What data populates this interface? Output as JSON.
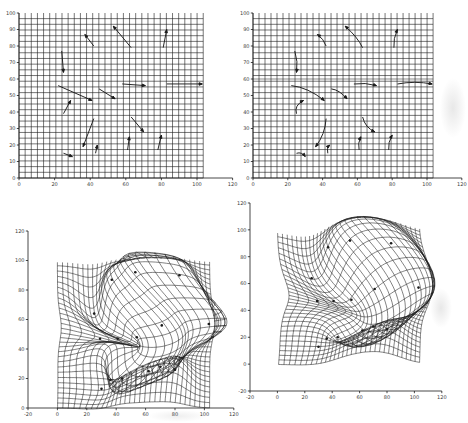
{
  "figure": {
    "background": "#ffffff",
    "ink": "#1b1b1b",
    "label_color": "#3a3a3a"
  },
  "landmarks": {
    "source": [
      [
        24,
        77
      ],
      [
        42,
        80
      ],
      [
        63,
        79
      ],
      [
        81,
        79
      ],
      [
        22,
        56
      ],
      [
        45,
        54
      ],
      [
        58,
        57
      ],
      [
        83,
        57
      ],
      [
        25,
        39
      ],
      [
        42,
        36
      ],
      [
        63,
        37
      ],
      [
        25,
        15
      ],
      [
        43,
        15
      ],
      [
        61,
        17
      ],
      [
        78,
        17
      ]
    ],
    "target": [
      [
        25,
        64
      ],
      [
        37,
        87
      ],
      [
        53,
        92
      ],
      [
        83,
        90
      ],
      [
        41,
        47
      ],
      [
        54,
        48
      ],
      [
        71,
        56
      ],
      [
        103,
        57
      ],
      [
        29,
        47
      ],
      [
        36,
        19
      ],
      [
        70,
        28
      ],
      [
        30,
        13
      ],
      [
        44,
        20
      ],
      [
        62,
        25
      ],
      [
        80,
        26
      ]
    ],
    "curve_ctrl_offsets": [
      [
        1.5,
        0
      ],
      [
        1,
        1
      ],
      [
        2,
        0
      ],
      [
        -1.5,
        0
      ],
      [
        0,
        3.5
      ],
      [
        0,
        2.5
      ],
      [
        0,
        1.5
      ],
      [
        0,
        2
      ],
      [
        -3.5,
        1
      ],
      [
        2.5,
        -1
      ],
      [
        -2,
        -2
      ],
      [
        0.5,
        2
      ],
      [
        -1.5,
        0.5
      ],
      [
        -1.5,
        0
      ],
      [
        -1.5,
        0
      ]
    ]
  },
  "chart_data": [
    {
      "id": "top-left",
      "type": "scatter",
      "subtype": "vector-field-on-regular-grid",
      "title": "",
      "xlabel": "",
      "ylabel": "",
      "x_range": [
        0,
        120
      ],
      "y_range": [
        0,
        100
      ],
      "x_ticks": [
        0,
        20,
        40,
        60,
        80,
        100,
        120
      ],
      "y_ticks": [
        0,
        10,
        20,
        30,
        40,
        50,
        60,
        70,
        80,
        90,
        100
      ],
      "grid": {
        "x0": 0,
        "x1": 103.5,
        "y0": 0,
        "y1": 100,
        "step": 3.45
      },
      "path_style": "straight"
    },
    {
      "id": "top-right",
      "type": "scatter",
      "subtype": "vector-field-on-regular-grid",
      "title": "",
      "xlabel": "",
      "ylabel": "",
      "x_range": [
        0,
        120
      ],
      "y_range": [
        0,
        100
      ],
      "x_ticks": [
        0,
        20,
        40,
        60,
        80,
        100,
        120
      ],
      "y_ticks": [
        0,
        10,
        20,
        30,
        40,
        50,
        60,
        70,
        80,
        90,
        100
      ],
      "grid": {
        "x0": 0,
        "x1": 103.5,
        "y0": 0,
        "y1": 100,
        "step": 3.45
      },
      "path_style": "curved",
      "scan_streak_y": 60
    },
    {
      "id": "bottom-left",
      "type": "scatter",
      "subtype": "warped-grid-with-landmarks",
      "title": "",
      "xlabel": "",
      "ylabel": "",
      "x_range": [
        -20,
        120
      ],
      "y_range": [
        0,
        120
      ],
      "x_ticks": [
        -20,
        0,
        20,
        40,
        60,
        80,
        100,
        120
      ],
      "y_ticks": [
        0,
        20,
        40,
        60,
        80,
        100,
        120
      ],
      "grid": {
        "x0": 0,
        "x1": 103.5,
        "y0": 0,
        "y1": 100,
        "step": 3.45
      },
      "warp": {
        "sigma": 10,
        "strength": 1.5
      },
      "show_landmark_dots": true
    },
    {
      "id": "bottom-right",
      "type": "scatter",
      "subtype": "warped-grid-with-landmarks",
      "title": "",
      "xlabel": "",
      "ylabel": "",
      "x_range": [
        -20,
        120
      ],
      "y_range": [
        -20,
        120
      ],
      "x_ticks": [
        -20,
        0,
        20,
        40,
        60,
        80,
        100,
        120
      ],
      "y_ticks": [
        -20,
        0,
        20,
        40,
        60,
        80,
        100,
        120
      ],
      "grid": {
        "x0": 0,
        "x1": 103.5,
        "y0": 0,
        "y1": 100,
        "step": 3.45
      },
      "warp": {
        "sigma": 14.5,
        "strength": 1.28
      },
      "show_landmark_dots": true
    }
  ]
}
